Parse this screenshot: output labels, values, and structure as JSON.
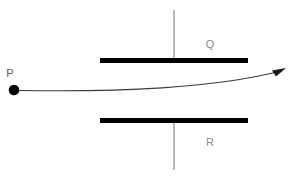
{
  "figure": {
    "type": "physics-diagram",
    "canvas": {
      "width": 297,
      "height": 178,
      "background": "#ffffff"
    }
  },
  "labels": {
    "source_point": "P",
    "top_plate": "Q",
    "bottom_plate": "R"
  },
  "colors": {
    "plate": "#000000",
    "particle": "#000000",
    "trajectory": "#3b3b3b",
    "lead_wire": "#9a9a9a",
    "label_plate": "#8a8a8a",
    "label_point": "#555555"
  },
  "geometry": {
    "particle": {
      "cx": 14,
      "cy": 90,
      "r": 5
    },
    "particle_label_pos": {
      "x": 10,
      "y": 77
    },
    "top_plate": {
      "x1": 100,
      "x2": 248,
      "y": 60,
      "thickness": 5
    },
    "bottom_plate": {
      "x1": 100,
      "x2": 248,
      "y": 120,
      "thickness": 5
    },
    "top_plate_label_pos": {
      "x": 206,
      "y": 48
    },
    "bottom_plate_label_pos": {
      "x": 206,
      "y": 146
    },
    "top_lead": {
      "x": 174,
      "y1": 10,
      "y2": 58
    },
    "bottom_lead": {
      "x": 174,
      "y1": 122,
      "y2": 170
    },
    "trajectory": {
      "start": {
        "x": 19,
        "y": 90
      },
      "control1": {
        "x": 120,
        "y": 92
      },
      "control2": {
        "x": 210,
        "y": 88
      },
      "end": {
        "x": 281,
        "y": 71
      },
      "stroke_width": 1
    },
    "arrowhead": {
      "x": 283,
      "y": 70,
      "size": 8,
      "angle_deg": -20
    }
  }
}
